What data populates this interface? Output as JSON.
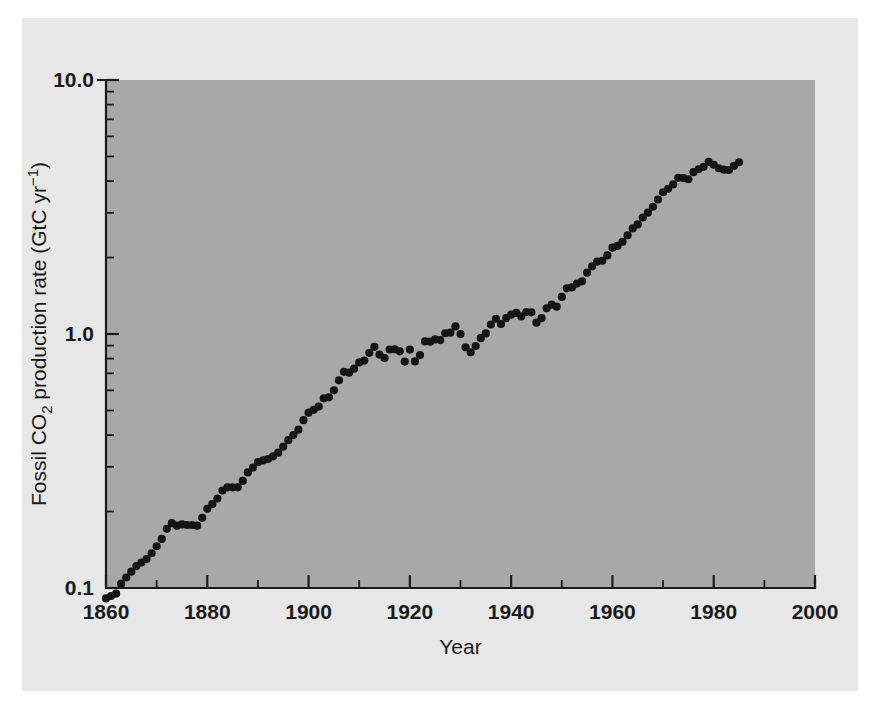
{
  "figure": {
    "background_color": "#e7e7e7",
    "plot_area_color": "#a8a8a8",
    "ink_color": "#151515"
  },
  "axes": {
    "x_title": "Year",
    "y_title_parts": {
      "prefix": "Fossil CO",
      "subscript": "2",
      "middle": " production rate (GtC yr",
      "superscript": "−1",
      "suffix": ")"
    },
    "x_tick_labels": [
      "1860",
      "1880",
      "1900",
      "1920",
      "1940",
      "1960",
      "1980",
      "2000"
    ],
    "y_tick_labels": [
      "0.1",
      "1.0",
      "10.0"
    ]
  },
  "chart_data": {
    "type": "scatter",
    "title": "",
    "xlabel": "Year",
    "ylabel": "Fossil CO2 production rate (GtC yr-1)",
    "xlim": [
      1860,
      2000
    ],
    "ylim": [
      0.1,
      10.0
    ],
    "yscale": "log",
    "xscale": "linear",
    "grid": false,
    "legend": "none",
    "x_major_ticks": [
      1860,
      1880,
      1900,
      1920,
      1940,
      1960,
      1980,
      2000
    ],
    "x_minor_ticks": [
      1870,
      1890,
      1910,
      1930,
      1950,
      1970,
      1990
    ],
    "y_major_ticks": [
      0.1,
      1.0,
      10.0
    ],
    "y_minor_ticks": [
      0.2,
      0.3,
      0.4,
      0.5,
      0.6,
      0.7,
      0.8,
      0.9,
      2,
      3,
      4,
      5,
      6,
      7,
      8,
      9
    ],
    "marker": "filled-circle",
    "series": [
      {
        "name": "Fossil CO2 production rate",
        "x": [
          1860,
          1861,
          1862,
          1863,
          1864,
          1865,
          1866,
          1867,
          1868,
          1869,
          1870,
          1871,
          1872,
          1873,
          1874,
          1875,
          1876,
          1877,
          1878,
          1879,
          1880,
          1881,
          1882,
          1883,
          1884,
          1885,
          1886,
          1887,
          1888,
          1889,
          1890,
          1891,
          1892,
          1893,
          1894,
          1895,
          1896,
          1897,
          1898,
          1899,
          1900,
          1901,
          1902,
          1903,
          1904,
          1905,
          1906,
          1907,
          1908,
          1909,
          1910,
          1911,
          1912,
          1913,
          1914,
          1915,
          1916,
          1917,
          1918,
          1919,
          1920,
          1921,
          1922,
          1923,
          1924,
          1925,
          1926,
          1927,
          1928,
          1929,
          1930,
          1931,
          1932,
          1933,
          1934,
          1935,
          1936,
          1937,
          1938,
          1939,
          1940,
          1941,
          1942,
          1943,
          1944,
          1945,
          1946,
          1947,
          1948,
          1949,
          1950,
          1951,
          1952,
          1953,
          1954,
          1955,
          1956,
          1957,
          1958,
          1959,
          1960,
          1961,
          1962,
          1963,
          1964,
          1965,
          1966,
          1967,
          1968,
          1969,
          1970,
          1971,
          1972,
          1973,
          1974,
          1975,
          1976,
          1977,
          1978,
          1979,
          1980,
          1981,
          1982,
          1983,
          1984,
          1985
        ],
        "y": [
          0.091,
          0.093,
          0.095,
          0.104,
          0.11,
          0.116,
          0.122,
          0.126,
          0.13,
          0.137,
          0.146,
          0.156,
          0.171,
          0.18,
          0.176,
          0.178,
          0.177,
          0.177,
          0.176,
          0.189,
          0.205,
          0.214,
          0.225,
          0.242,
          0.249,
          0.249,
          0.249,
          0.264,
          0.285,
          0.298,
          0.313,
          0.318,
          0.322,
          0.33,
          0.341,
          0.36,
          0.382,
          0.4,
          0.42,
          0.458,
          0.49,
          0.503,
          0.518,
          0.558,
          0.563,
          0.6,
          0.657,
          0.71,
          0.704,
          0.73,
          0.773,
          0.786,
          0.843,
          0.89,
          0.83,
          0.804,
          0.869,
          0.87,
          0.855,
          0.779,
          0.868,
          0.78,
          0.826,
          0.935,
          0.933,
          0.952,
          0.946,
          1.007,
          1.012,
          1.071,
          0.999,
          0.887,
          0.847,
          0.896,
          0.963,
          1.005,
          1.09,
          1.148,
          1.095,
          1.155,
          1.191,
          1.212,
          1.173,
          1.22,
          1.217,
          1.108,
          1.154,
          1.262,
          1.305,
          1.281,
          1.399,
          1.513,
          1.525,
          1.58,
          1.612,
          1.744,
          1.847,
          1.929,
          1.943,
          2.039,
          2.188,
          2.223,
          2.308,
          2.448,
          2.603,
          2.699,
          2.875,
          3.004,
          3.17,
          3.384,
          3.614,
          3.731,
          3.882,
          4.118,
          4.112,
          4.067,
          4.338,
          4.453,
          4.553,
          4.762,
          4.637,
          4.494,
          4.437,
          4.422,
          4.589,
          4.744
        ]
      }
    ]
  }
}
